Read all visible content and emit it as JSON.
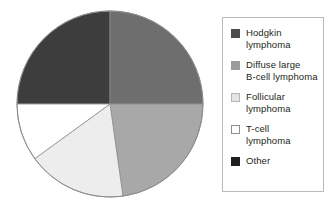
{
  "chart_data": {
    "type": "pie",
    "title": "",
    "subtitle": "",
    "xlabel": "",
    "ylabel": "",
    "grid": false,
    "legend_position": "right",
    "start_angle_deg": 0,
    "direction": "clockwise",
    "categories": [
      "Hodgkin lymphoma",
      "Diffuse large B-cell lymphoma",
      "Follicular lymphoma",
      "T-cell lymphoma",
      "Other"
    ],
    "values": [
      25,
      25,
      23,
      17,
      10
    ],
    "units": "percent",
    "colors": [
      "#3d3d3d",
      "#6e6e6e",
      "#a8a8a8",
      "#ededed",
      "#ffffff"
    ],
    "slices": [
      {
        "label": "Hodgkin lymphoma",
        "value": 25,
        "color": "#3d3d3d",
        "start_deg": 270,
        "end_deg": 360
      },
      {
        "label": "Diffuse large B-cell lymphoma",
        "value": 25,
        "color": "#6e6e6e",
        "start_deg": 0,
        "end_deg": 90
      },
      {
        "label": "Follicular lymphoma",
        "value": 23,
        "color": "#a8a8a8",
        "start_deg": 90,
        "end_deg": 172
      },
      {
        "label": "T-cell lymphoma",
        "value": 17,
        "color": "#ededed",
        "start_deg": 172,
        "end_deg": 234
      },
      {
        "label": "Other",
        "value": 10,
        "color": "#ffffff",
        "start_deg": 234,
        "end_deg": 270
      }
    ],
    "outline_color": "#8c8c8c"
  },
  "pie": {
    "center_x": 96,
    "center_y": 96,
    "radius": 93
  },
  "legend": {
    "items": [
      {
        "label": "Hodgkin\nlymphoma",
        "swatch_fill": "#4d4d4d",
        "swatch_border": "#4d4d4d"
      },
      {
        "label": "Diffuse large\nB-cell lymphoma",
        "swatch_fill": "#9b9b9b",
        "swatch_border": "#9b9b9b"
      },
      {
        "label": "Follicular\nlymphoma",
        "swatch_fill": "#e4e4e4",
        "swatch_border": "#b5b5b5"
      },
      {
        "label": "T-cell\nlymphoma",
        "swatch_fill": "#ffffff",
        "swatch_border": "#8f8f8f"
      },
      {
        "label": "Other",
        "swatch_fill": "#1f1f1f",
        "swatch_border": "#1f1f1f"
      }
    ]
  }
}
